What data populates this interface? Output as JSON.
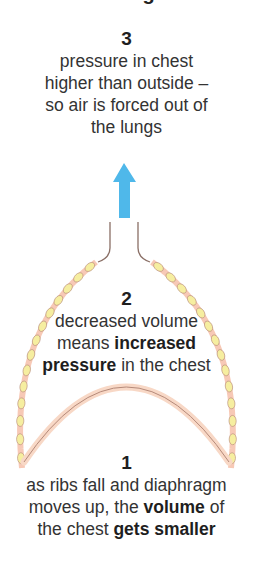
{
  "heading": "Breathing out",
  "steps": [
    {
      "number": "3",
      "lines": [
        [
          {
            "t": "pressure in chest"
          }
        ],
        [
          {
            "t": "higher than outside –"
          }
        ],
        [
          {
            "t": "so air is forced out of"
          }
        ],
        [
          {
            "t": "the lungs"
          }
        ]
      ]
    },
    {
      "number": "2",
      "lines": [
        [
          {
            "t": "decreased volume"
          }
        ],
        [
          {
            "t": "means "
          },
          {
            "t": "increased",
            "b": true
          }
        ],
        [
          {
            "t": "pressure",
            "b": true
          },
          {
            "t": " in the chest"
          }
        ]
      ]
    },
    {
      "number": "1",
      "lines": [
        [
          {
            "t": "as ribs fall and diaphragm"
          }
        ],
        [
          {
            "t": "moves up, the "
          },
          {
            "t": "volume",
            "b": true
          },
          {
            "t": " of"
          }
        ],
        [
          {
            "t": "the chest "
          },
          {
            "t": "gets smaller",
            "b": true
          }
        ]
      ]
    }
  ],
  "colors": {
    "arrow": "#4fb8ea",
    "rib_fill": "#f7c9b6",
    "rib_stroke": "#b58a7a",
    "cartilage": "#f6eea0",
    "diaphragm": "#f8d8c6",
    "trachea": "#8a6f66"
  },
  "arrow_direction": "up"
}
